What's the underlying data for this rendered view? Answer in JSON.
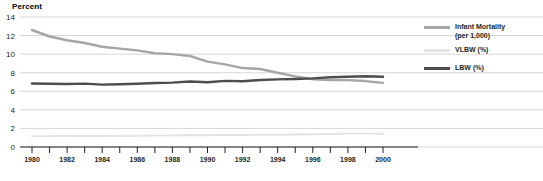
{
  "chart_data": {
    "type": "line",
    "title": "",
    "ylabel": "Percent",
    "xlabel": "",
    "ylim": [
      0,
      14
    ],
    "ytick_step": 2,
    "yticks": [
      0,
      2,
      4,
      6,
      8,
      10,
      12,
      14
    ],
    "xlim": [
      1980,
      2000
    ],
    "x": [
      1980,
      1981,
      1982,
      1983,
      1984,
      1985,
      1986,
      1987,
      1988,
      1989,
      1990,
      1991,
      1992,
      1993,
      1994,
      1995,
      1996,
      1997,
      1998,
      1999,
      2000
    ],
    "xtick_labels": [
      "1980",
      "",
      "1982",
      "",
      "1984",
      "",
      "1986",
      "",
      "1988",
      "",
      "1990",
      "",
      "1992",
      "",
      "1994",
      "",
      "1996",
      "",
      "1998",
      "",
      "2000"
    ],
    "grid": true,
    "grid_axis": "y",
    "legend_position": "right",
    "series": [
      {
        "name": "Infant Mortality\n(per 1,000)",
        "legend_label": "Infant Mortality\n(per 1,000)",
        "color": "#a6a6a6",
        "values": [
          12.6,
          11.9,
          11.5,
          11.2,
          10.8,
          10.6,
          10.4,
          10.1,
          10.0,
          9.8,
          9.2,
          8.9,
          8.5,
          8.4,
          8.0,
          7.6,
          7.3,
          7.2,
          7.2,
          7.1,
          6.9
        ]
      },
      {
        "name": "VLBW (%)",
        "legend_label": "VLBW (%)",
        "color": "#e3e3e3",
        "values": [
          1.15,
          1.16,
          1.18,
          1.19,
          1.19,
          1.21,
          1.21,
          1.24,
          1.24,
          1.28,
          1.27,
          1.29,
          1.29,
          1.33,
          1.33,
          1.35,
          1.37,
          1.4,
          1.45,
          1.45,
          1.43
        ]
      },
      {
        "name": "LBW (%)",
        "legend_label": "LBW (%)",
        "color": "#4d4d4d",
        "values": [
          6.84,
          6.81,
          6.78,
          6.82,
          6.72,
          6.75,
          6.81,
          6.9,
          6.93,
          7.05,
          6.97,
          7.12,
          7.08,
          7.22,
          7.28,
          7.32,
          7.39,
          7.51,
          7.57,
          7.62,
          7.57
        ]
      }
    ],
    "colors": {
      "grid": "#cccccc",
      "axis": "#231f20",
      "text": "#231f20",
      "background": "#ffffff"
    }
  }
}
